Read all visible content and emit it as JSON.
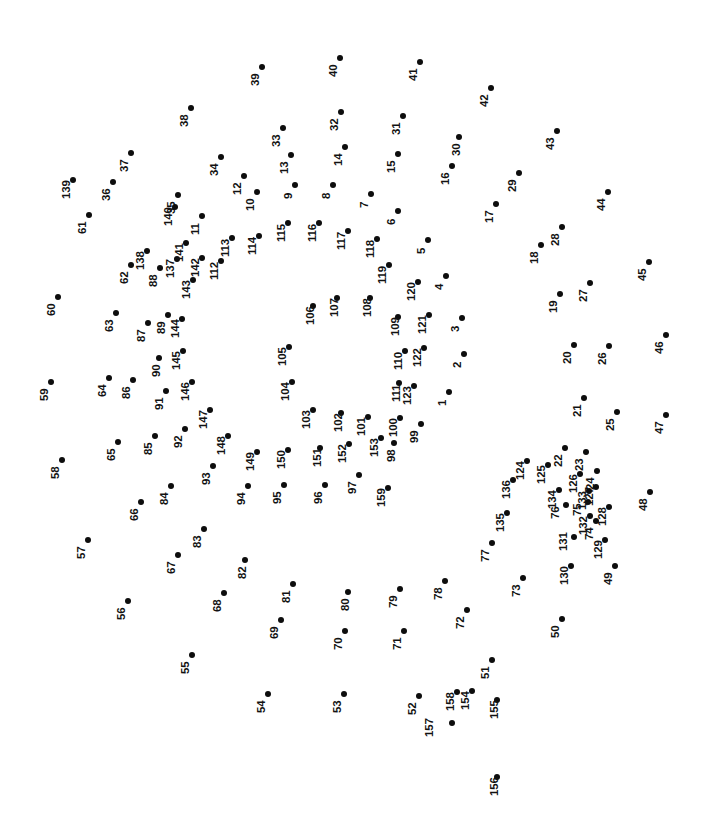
{
  "page": {
    "type": "connect-the-dots-puzzle",
    "background_color": "#ffffff",
    "dot_color": "#0d0d0d",
    "label_color": "#121212",
    "label_rotation_deg": -90,
    "width": 711,
    "height": 814,
    "dot_count": 159
  },
  "dots": [
    {
      "n": "1",
      "x": 449,
      "y": 392,
      "lx": -12,
      "ly": 14
    },
    {
      "n": "2",
      "x": 464,
      "y": 354,
      "lx": -12,
      "ly": 14
    },
    {
      "n": "3",
      "x": 462,
      "y": 318,
      "lx": -12,
      "ly": 14
    },
    {
      "n": "4",
      "x": 446,
      "y": 276,
      "lx": -12,
      "ly": 14
    },
    {
      "n": "5",
      "x": 428,
      "y": 240,
      "lx": -12,
      "ly": 14
    },
    {
      "n": "6",
      "x": 398,
      "y": 211,
      "lx": -12,
      "ly": 14
    },
    {
      "n": "7",
      "x": 371,
      "y": 194,
      "lx": -12,
      "ly": 14
    },
    {
      "n": "8",
      "x": 333,
      "y": 185,
      "lx": -12,
      "ly": 14
    },
    {
      "n": "9",
      "x": 295,
      "y": 185,
      "lx": -12,
      "ly": 14
    },
    {
      "n": "10",
      "x": 257,
      "y": 192,
      "lx": -12,
      "ly": 19
    },
    {
      "n": "11",
      "x": 202,
      "y": 216,
      "lx": -12,
      "ly": 19
    },
    {
      "n": "12",
      "x": 244,
      "y": 176,
      "lx": -12,
      "ly": 19
    },
    {
      "n": "13",
      "x": 291,
      "y": 155,
      "lx": -12,
      "ly": 19
    },
    {
      "n": "14",
      "x": 345,
      "y": 147,
      "lx": -12,
      "ly": 19
    },
    {
      "n": "15",
      "x": 398,
      "y": 154,
      "lx": -12,
      "ly": 19
    },
    {
      "n": "16",
      "x": 452,
      "y": 166,
      "lx": -12,
      "ly": 19
    },
    {
      "n": "17",
      "x": 496,
      "y": 204,
      "lx": -12,
      "ly": 19
    },
    {
      "n": "18",
      "x": 541,
      "y": 245,
      "lx": -12,
      "ly": 19
    },
    {
      "n": "19",
      "x": 560,
      "y": 294,
      "lx": -12,
      "ly": 19
    },
    {
      "n": "20",
      "x": 574,
      "y": 345,
      "lx": -12,
      "ly": 19
    },
    {
      "n": "21",
      "x": 584,
      "y": 398,
      "lx": -12,
      "ly": 19
    },
    {
      "n": "22",
      "x": 565,
      "y": 448,
      "lx": -12,
      "ly": 19
    },
    {
      "n": "23",
      "x": 586,
      "y": 452,
      "lx": -12,
      "ly": 19
    },
    {
      "n": "24",
      "x": 597,
      "y": 471,
      "lx": -12,
      "ly": 19
    },
    {
      "n": "25",
      "x": 617,
      "y": 412,
      "lx": -12,
      "ly": 19
    },
    {
      "n": "26",
      "x": 609,
      "y": 346,
      "lx": -12,
      "ly": 19
    },
    {
      "n": "27",
      "x": 590,
      "y": 283,
      "lx": -12,
      "ly": 19
    },
    {
      "n": "28",
      "x": 562,
      "y": 227,
      "lx": -12,
      "ly": 19
    },
    {
      "n": "29",
      "x": 519,
      "y": 173,
      "lx": -12,
      "ly": 19
    },
    {
      "n": "30",
      "x": 459,
      "y": 137,
      "lx": -8,
      "ly": 19
    },
    {
      "n": "31",
      "x": 403,
      "y": 116,
      "lx": -12,
      "ly": 19
    },
    {
      "n": "32",
      "x": 341,
      "y": 112,
      "lx": -12,
      "ly": 19
    },
    {
      "n": "33",
      "x": 283,
      "y": 128,
      "lx": -12,
      "ly": 19
    },
    {
      "n": "34",
      "x": 221,
      "y": 157,
      "lx": -12,
      "ly": 19
    },
    {
      "n": "35",
      "x": 178,
      "y": 195,
      "lx": -12,
      "ly": 19
    },
    {
      "n": "36",
      "x": 113,
      "y": 182,
      "lx": -12,
      "ly": 19
    },
    {
      "n": "37",
      "x": 131,
      "y": 153,
      "lx": -12,
      "ly": 19
    },
    {
      "n": "38",
      "x": 191,
      "y": 108,
      "lx": -12,
      "ly": 19
    },
    {
      "n": "39",
      "x": 262,
      "y": 67,
      "lx": -12,
      "ly": 19
    },
    {
      "n": "40",
      "x": 340,
      "y": 58,
      "lx": -12,
      "ly": 19
    },
    {
      "n": "41",
      "x": 420,
      "y": 62,
      "lx": -12,
      "ly": 19
    },
    {
      "n": "42",
      "x": 491,
      "y": 88,
      "lx": -12,
      "ly": 19
    },
    {
      "n": "43",
      "x": 557,
      "y": 131,
      "lx": -12,
      "ly": 19
    },
    {
      "n": "44",
      "x": 608,
      "y": 192,
      "lx": -12,
      "ly": 19
    },
    {
      "n": "45",
      "x": 649,
      "y": 262,
      "lx": -12,
      "ly": 19
    },
    {
      "n": "46",
      "x": 666,
      "y": 335,
      "lx": -12,
      "ly": 19
    },
    {
      "n": "47",
      "x": 666,
      "y": 415,
      "lx": -12,
      "ly": 19
    },
    {
      "n": "48",
      "x": 650,
      "y": 492,
      "lx": -12,
      "ly": 19
    },
    {
      "n": "49",
      "x": 615,
      "y": 566,
      "lx": -12,
      "ly": 19
    },
    {
      "n": "50",
      "x": 562,
      "y": 619,
      "lx": -12,
      "ly": 19
    },
    {
      "n": "51",
      "x": 492,
      "y": 660,
      "lx": -12,
      "ly": 19
    },
    {
      "n": "52",
      "x": 419,
      "y": 696,
      "lx": -12,
      "ly": 19
    },
    {
      "n": "53",
      "x": 344,
      "y": 694,
      "lx": -12,
      "ly": 19
    },
    {
      "n": "54",
      "x": 268,
      "y": 694,
      "lx": -12,
      "ly": 19
    },
    {
      "n": "55",
      "x": 192,
      "y": 655,
      "lx": -12,
      "ly": 19
    },
    {
      "n": "56",
      "x": 128,
      "y": 601,
      "lx": -12,
      "ly": 19
    },
    {
      "n": "57",
      "x": 88,
      "y": 540,
      "lx": -12,
      "ly": 19
    },
    {
      "n": "58",
      "x": 62,
      "y": 460,
      "lx": -12,
      "ly": 19
    },
    {
      "n": "59",
      "x": 51,
      "y": 382,
      "lx": -12,
      "ly": 19
    },
    {
      "n": "60",
      "x": 58,
      "y": 297,
      "lx": -12,
      "ly": 19
    },
    {
      "n": "61",
      "x": 89,
      "y": 215,
      "lx": -12,
      "ly": 19
    },
    {
      "n": "62",
      "x": 131,
      "y": 265,
      "lx": -12,
      "ly": 19
    },
    {
      "n": "63",
      "x": 116,
      "y": 313,
      "lx": -12,
      "ly": 19
    },
    {
      "n": "64",
      "x": 109,
      "y": 378,
      "lx": -12,
      "ly": 19
    },
    {
      "n": "65",
      "x": 118,
      "y": 442,
      "lx": -12,
      "ly": 19
    },
    {
      "n": "66",
      "x": 141,
      "y": 502,
      "lx": -12,
      "ly": 19
    },
    {
      "n": "67",
      "x": 178,
      "y": 555,
      "lx": -12,
      "ly": 19
    },
    {
      "n": "68",
      "x": 224,
      "y": 593,
      "lx": -12,
      "ly": 19
    },
    {
      "n": "69",
      "x": 281,
      "y": 620,
      "lx": -12,
      "ly": 19
    },
    {
      "n": "70",
      "x": 345,
      "y": 631,
      "lx": -12,
      "ly": 19
    },
    {
      "n": "71",
      "x": 404,
      "y": 631,
      "lx": -12,
      "ly": 19
    },
    {
      "n": "72",
      "x": 467,
      "y": 610,
      "lx": -12,
      "ly": 19
    },
    {
      "n": "73",
      "x": 523,
      "y": 578,
      "lx": -12,
      "ly": 19
    },
    {
      "n": "74",
      "x": 596,
      "y": 521,
      "lx": -12,
      "ly": 19
    },
    {
      "n": "75",
      "x": 588,
      "y": 502,
      "lx": -16,
      "ly": 14
    },
    {
      "n": "76",
      "x": 566,
      "y": 505,
      "lx": -16,
      "ly": 14
    },
    {
      "n": "77",
      "x": 492,
      "y": 543,
      "lx": -12,
      "ly": 19
    },
    {
      "n": "78",
      "x": 445,
      "y": 581,
      "lx": -12,
      "ly": 19
    },
    {
      "n": "79",
      "x": 400,
      "y": 589,
      "lx": -12,
      "ly": 19
    },
    {
      "n": "80",
      "x": 348,
      "y": 592,
      "lx": -8,
      "ly": 19
    },
    {
      "n": "81",
      "x": 293,
      "y": 584,
      "lx": -12,
      "ly": 19
    },
    {
      "n": "82",
      "x": 245,
      "y": 560,
      "lx": -8,
      "ly": 19
    },
    {
      "n": "83",
      "x": 204,
      "y": 529,
      "lx": -12,
      "ly": 19
    },
    {
      "n": "84",
      "x": 171,
      "y": 486,
      "lx": -12,
      "ly": 19
    },
    {
      "n": "85",
      "x": 155,
      "y": 436,
      "lx": -12,
      "ly": 19
    },
    {
      "n": "86",
      "x": 133,
      "y": 380,
      "lx": -12,
      "ly": 19
    },
    {
      "n": "87",
      "x": 148,
      "y": 323,
      "lx": -12,
      "ly": 19
    },
    {
      "n": "88",
      "x": 160,
      "y": 268,
      "lx": -12,
      "ly": 19
    },
    {
      "n": "89",
      "x": 168,
      "y": 315,
      "lx": -12,
      "ly": 19
    },
    {
      "n": "90",
      "x": 159,
      "y": 358,
      "lx": -8,
      "ly": 19
    },
    {
      "n": "91",
      "x": 166,
      "y": 391,
      "lx": -12,
      "ly": 19
    },
    {
      "n": "92",
      "x": 185,
      "y": 429,
      "lx": -12,
      "ly": 19
    },
    {
      "n": "93",
      "x": 213,
      "y": 466,
      "lx": -12,
      "ly": 19
    },
    {
      "n": "94",
      "x": 248,
      "y": 486,
      "lx": -12,
      "ly": 19
    },
    {
      "n": "95",
      "x": 284,
      "y": 485,
      "lx": -12,
      "ly": 19
    },
    {
      "n": "96",
      "x": 325,
      "y": 485,
      "lx": -12,
      "ly": 19
    },
    {
      "n": "97",
      "x": 359,
      "y": 475,
      "lx": -12,
      "ly": 19
    },
    {
      "n": "98",
      "x": 394,
      "y": 443,
      "lx": -8,
      "ly": 19
    },
    {
      "n": "99",
      "x": 421,
      "y": 424,
      "lx": -12,
      "ly": 19
    },
    {
      "n": "100",
      "x": 400,
      "y": 418,
      "lx": -12,
      "ly": 19
    },
    {
      "n": "101",
      "x": 368,
      "y": 417,
      "lx": -12,
      "ly": 19
    },
    {
      "n": "102",
      "x": 341,
      "y": 413,
      "lx": -8,
      "ly": 19
    },
    {
      "n": "103",
      "x": 313,
      "y": 410,
      "lx": -12,
      "ly": 19
    },
    {
      "n": "104",
      "x": 292,
      "y": 382,
      "lx": -12,
      "ly": 19
    },
    {
      "n": "105",
      "x": 289,
      "y": 347,
      "lx": -12,
      "ly": 19
    },
    {
      "n": "106",
      "x": 313,
      "y": 306,
      "lx": -8,
      "ly": 19
    },
    {
      "n": "107",
      "x": 337,
      "y": 298,
      "lx": -8,
      "ly": 19
    },
    {
      "n": "108",
      "x": 370,
      "y": 298,
      "lx": -8,
      "ly": 19
    },
    {
      "n": "109",
      "x": 398,
      "y": 317,
      "lx": -8,
      "ly": 19
    },
    {
      "n": "110",
      "x": 405,
      "y": 351,
      "lx": -12,
      "ly": 19
    },
    {
      "n": "111",
      "x": 399,
      "y": 383,
      "lx": -8,
      "ly": 19
    },
    {
      "n": "112",
      "x": 221,
      "y": 261,
      "lx": -12,
      "ly": 19
    },
    {
      "n": "113",
      "x": 232,
      "y": 238,
      "lx": -12,
      "ly": 19
    },
    {
      "n": "114",
      "x": 259,
      "y": 236,
      "lx": -12,
      "ly": 19
    },
    {
      "n": "115",
      "x": 288,
      "y": 223,
      "lx": -12,
      "ly": 19
    },
    {
      "n": "116",
      "x": 319,
      "y": 223,
      "lx": -12,
      "ly": 19
    },
    {
      "n": "117",
      "x": 348,
      "y": 231,
      "lx": -12,
      "ly": 19
    },
    {
      "n": "118",
      "x": 377,
      "y": 239,
      "lx": -12,
      "ly": 19
    },
    {
      "n": "119",
      "x": 389,
      "y": 265,
      "lx": -12,
      "ly": 19
    },
    {
      "n": "120",
      "x": 418,
      "y": 282,
      "lx": -12,
      "ly": 19
    },
    {
      "n": "121",
      "x": 429,
      "y": 315,
      "lx": -12,
      "ly": 19
    },
    {
      "n": "122",
      "x": 424,
      "y": 348,
      "lx": -12,
      "ly": 19
    },
    {
      "n": "123",
      "x": 414,
      "y": 386,
      "lx": -12,
      "ly": 19
    },
    {
      "n": "124",
      "x": 527,
      "y": 461,
      "lx": -12,
      "ly": 19
    },
    {
      "n": "125",
      "x": 548,
      "y": 465,
      "lx": -12,
      "ly": 19
    },
    {
      "n": "126",
      "x": 580,
      "y": 474,
      "lx": -12,
      "ly": 19
    },
    {
      "n": "127",
      "x": 596,
      "y": 487,
      "lx": -12,
      "ly": 19
    },
    {
      "n": "128",
      "x": 609,
      "y": 507,
      "lx": -12,
      "ly": 19
    },
    {
      "n": "129",
      "x": 605,
      "y": 540,
      "lx": -12,
      "ly": 19
    },
    {
      "n": "130",
      "x": 571,
      "y": 566,
      "lx": -12,
      "ly": 19
    },
    {
      "n": "131",
      "x": 574,
      "y": 537,
      "lx": -16,
      "ly": 14
    },
    {
      "n": "132",
      "x": 590,
      "y": 516,
      "lx": -12,
      "ly": 19
    },
    {
      "n": "133",
      "x": 589,
      "y": 491,
      "lx": -12,
      "ly": 19
    },
    {
      "n": "134",
      "x": 559,
      "y": 490,
      "lx": -12,
      "ly": 19
    },
    {
      "n": "135",
      "x": 507,
      "y": 513,
      "lx": -12,
      "ly": 19
    },
    {
      "n": "136",
      "x": 513,
      "y": 480,
      "lx": -12,
      "ly": 19
    },
    {
      "n": "137",
      "x": 177,
      "y": 259,
      "lx": -12,
      "ly": 19
    },
    {
      "n": "138",
      "x": 147,
      "y": 251,
      "lx": -12,
      "ly": 19
    },
    {
      "n": "139",
      "x": 73,
      "y": 180,
      "lx": -12,
      "ly": 19
    },
    {
      "n": "140",
      "x": 175,
      "y": 207,
      "lx": -12,
      "ly": 19
    },
    {
      "n": "141",
      "x": 186,
      "y": 243,
      "lx": -12,
      "ly": 19
    },
    {
      "n": "142",
      "x": 202,
      "y": 258,
      "lx": -12,
      "ly": 19
    },
    {
      "n": "143",
      "x": 193,
      "y": 280,
      "lx": -12,
      "ly": 19
    },
    {
      "n": "144",
      "x": 182,
      "y": 319,
      "lx": -12,
      "ly": 19
    },
    {
      "n": "145",
      "x": 183,
      "y": 351,
      "lx": -12,
      "ly": 19
    },
    {
      "n": "146",
      "x": 192,
      "y": 382,
      "lx": -12,
      "ly": 19
    },
    {
      "n": "147",
      "x": 210,
      "y": 410,
      "lx": -12,
      "ly": 19
    },
    {
      "n": "148",
      "x": 228,
      "y": 436,
      "lx": -12,
      "ly": 19
    },
    {
      "n": "149",
      "x": 257,
      "y": 452,
      "lx": -12,
      "ly": 19
    },
    {
      "n": "150",
      "x": 288,
      "y": 450,
      "lx": -12,
      "ly": 19
    },
    {
      "n": "151",
      "x": 320,
      "y": 448,
      "lx": -8,
      "ly": 19
    },
    {
      "n": "152",
      "x": 349,
      "y": 444,
      "lx": -12,
      "ly": 19
    },
    {
      "n": "153",
      "x": 381,
      "y": 438,
      "lx": -12,
      "ly": 19
    },
    {
      "n": "154",
      "x": 472,
      "y": 691,
      "lx": -12,
      "ly": 19
    },
    {
      "n": "155",
      "x": 497,
      "y": 700,
      "lx": -8,
      "ly": 19
    },
    {
      "n": "156",
      "x": 497,
      "y": 777,
      "lx": -8,
      "ly": 19
    },
    {
      "n": "157",
      "x": 452,
      "y": 723,
      "lx": -28,
      "ly": 14
    },
    {
      "n": "158",
      "x": 457,
      "y": 692,
      "lx": -12,
      "ly": 19
    },
    {
      "n": "159",
      "x": 388,
      "y": 488,
      "lx": -12,
      "ly": 19
    }
  ]
}
